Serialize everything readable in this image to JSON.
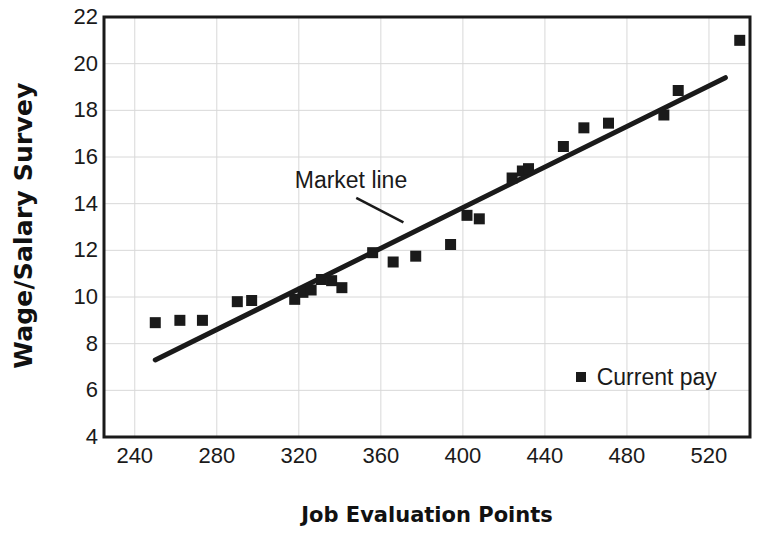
{
  "chart_data": {
    "type": "scatter",
    "title": "",
    "xlabel": "Job Evaluation Points",
    "ylabel": "Wage/Salary Survey",
    "xlim": [
      225,
      540
    ],
    "ylim": [
      4,
      22
    ],
    "xticks": [
      240,
      280,
      320,
      360,
      400,
      440,
      480,
      520
    ],
    "yticks": [
      4,
      6,
      8,
      10,
      12,
      14,
      16,
      18,
      20,
      22
    ],
    "grid": true,
    "grid_color": "#d8d8d8",
    "frame_color": "#1a1a1a",
    "marker_color": "#1a1a1a",
    "marker_shape": "square",
    "line_color": "#1a1a1a",
    "legend_position": "inside-lower-right",
    "series": [
      {
        "name": "Current pay",
        "marker": "square",
        "points": [
          [
            250,
            8.9
          ],
          [
            262,
            9.0
          ],
          [
            273,
            9.0
          ],
          [
            290,
            9.8
          ],
          [
            297,
            9.85
          ],
          [
            318,
            9.9
          ],
          [
            322,
            10.2
          ],
          [
            326,
            10.3
          ],
          [
            331,
            10.75
          ],
          [
            336,
            10.7
          ],
          [
            341,
            10.4
          ],
          [
            356,
            11.9
          ],
          [
            366,
            11.5
          ],
          [
            377,
            11.75
          ],
          [
            394,
            12.25
          ],
          [
            402,
            13.5
          ],
          [
            408,
            13.35
          ],
          [
            424,
            15.1
          ],
          [
            429,
            15.4
          ],
          [
            432,
            15.5
          ],
          [
            449,
            16.45
          ],
          [
            459,
            17.25
          ],
          [
            471,
            17.45
          ],
          [
            498,
            17.8
          ],
          [
            505,
            18.85
          ],
          [
            535,
            21.0
          ]
        ]
      }
    ],
    "trend_line": {
      "name": "Market line",
      "x0": 250,
      "y0": 7.3,
      "x1": 528,
      "y1": 19.4,
      "width": 5
    },
    "annotations": [
      {
        "name": "Market line",
        "text": "Market line",
        "text_x": 318,
        "text_y": 14.9,
        "arrow_from_x": 348,
        "arrow_from_y": 14.25,
        "arrow_to_x": 371,
        "arrow_to_y": 13.2
      }
    ],
    "legend": {
      "label": "Current pay",
      "x": 455,
      "y": 6.5
    }
  }
}
